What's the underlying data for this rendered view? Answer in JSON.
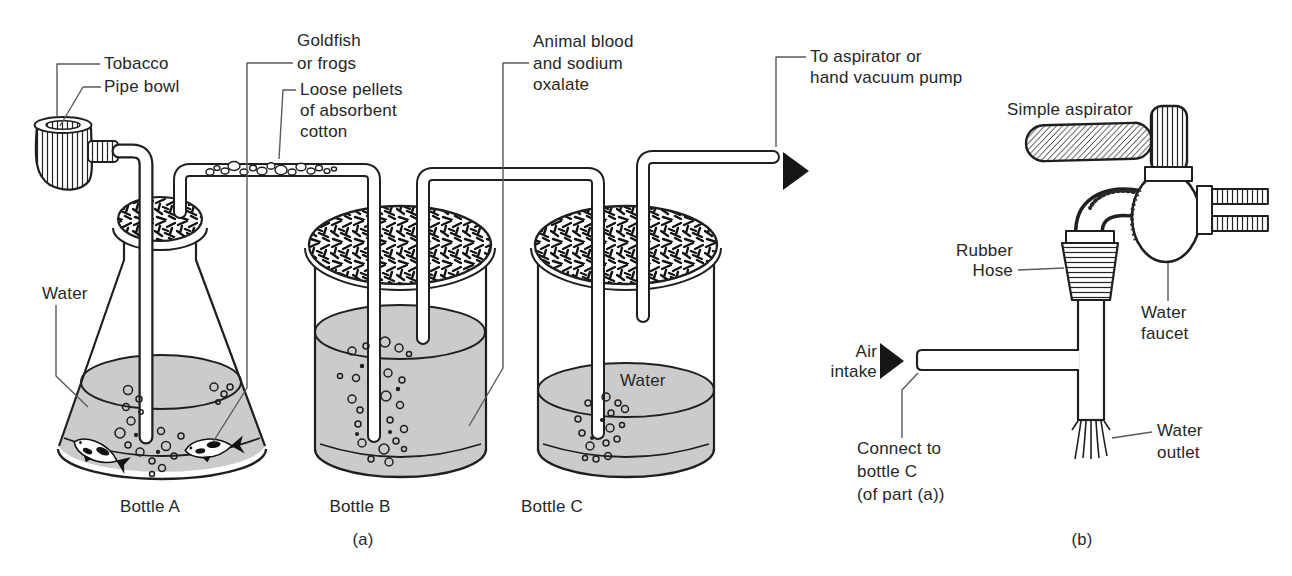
{
  "colors": {
    "paper": "#ffffff",
    "ink": "#1f1f1f",
    "water_gray": "#cbcbcb",
    "leader_gray": "#5a5a5a"
  },
  "part_a": {
    "caption": "(a)",
    "labels": {
      "tobacco": "Tobacco",
      "pipe_bowl": "Pipe bowl",
      "goldfish": [
        "Goldfish",
        "or frogs"
      ],
      "cotton": [
        "Loose pellets",
        "of absorbent",
        "cotton"
      ],
      "blood": [
        "Animal blood",
        "and sodium",
        "oxalate"
      ],
      "to_aspirator": [
        "To aspirator or",
        "hand vacuum pump"
      ],
      "water_flask": "Water",
      "water_bottle_c": "Water",
      "bottle_a": "Bottle A",
      "bottle_b": "Bottle B",
      "bottle_c": "Bottle C"
    }
  },
  "part_b": {
    "caption": "(b)",
    "labels": {
      "title": "Simple aspirator",
      "rubber_hose": [
        "Rubber",
        "Hose"
      ],
      "water_faucet": [
        "Water",
        "faucet"
      ],
      "air_intake": [
        "Air",
        "intake"
      ],
      "connect": [
        "Connect to",
        "bottle C",
        "(of part (a))"
      ],
      "water_outlet": [
        "Water",
        "outlet"
      ]
    }
  }
}
